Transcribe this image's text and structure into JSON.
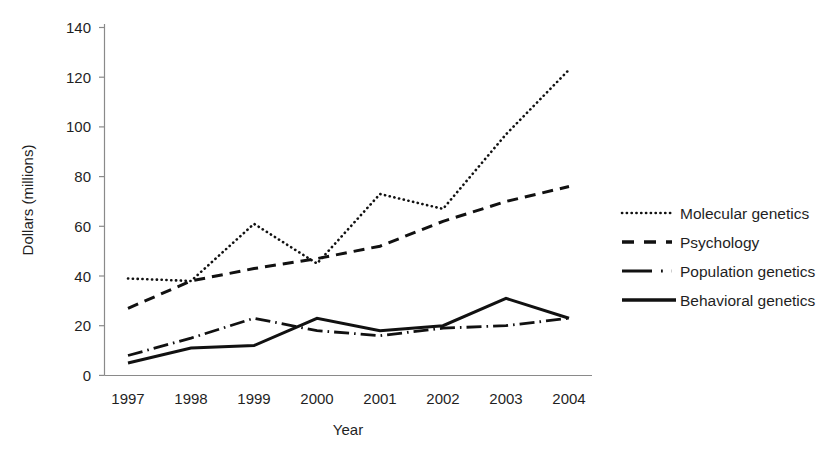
{
  "chart_data": {
    "type": "line",
    "title": "",
    "xlabel": "Year",
    "ylabel": "Dollars  (millions)",
    "categories": [
      "1997",
      "1998",
      "1999",
      "2000",
      "2001",
      "2002",
      "2003",
      "2004"
    ],
    "x": [
      1997,
      1998,
      1999,
      2000,
      2001,
      2002,
      2003,
      2004
    ],
    "xlim": [
      1997,
      2004
    ],
    "ylim": [
      0,
      140
    ],
    "yticks": [
      0,
      20,
      40,
      60,
      80,
      100,
      120,
      140
    ],
    "grid": false,
    "legend_position": "right",
    "series": [
      {
        "name": "Molecular genetics",
        "style": "dotted",
        "values": [
          39,
          38,
          61,
          45,
          73,
          67,
          97,
          123
        ]
      },
      {
        "name": "Psychology",
        "style": "dashed",
        "values": [
          27,
          38,
          43,
          47,
          52,
          62,
          70,
          76
        ]
      },
      {
        "name": "Population genetics",
        "style": "dash-dot",
        "values": [
          8,
          15,
          23,
          18,
          16,
          19,
          20,
          23
        ]
      },
      {
        "name": "Behavioral genetics",
        "style": "solid",
        "values": [
          5,
          11,
          12,
          23,
          18,
          20,
          31,
          23
        ]
      }
    ]
  },
  "axes": {
    "y_tick_labels": [
      "140",
      "120",
      "100",
      "80",
      "60",
      "40",
      "20",
      "0"
    ],
    "x_tick_labels": [
      "1997",
      "1998",
      "1999",
      "2000",
      "2001",
      "2002",
      "2003",
      "2004"
    ],
    "x_axis_title": "Year",
    "y_axis_title": "Dollars  (millions)"
  },
  "legend": {
    "items": [
      {
        "label": "Molecular genetics",
        "style": "dotted"
      },
      {
        "label": "Psychology",
        "style": "dashed"
      },
      {
        "label": "Population genetics",
        "style": "dash-dot"
      },
      {
        "label": "Behavioral genetics",
        "style": "solid"
      }
    ]
  },
  "colors": {
    "series": "#111111",
    "axis": "#8a8a8a",
    "text": "#1f1f1f",
    "background": "#ffffff"
  }
}
